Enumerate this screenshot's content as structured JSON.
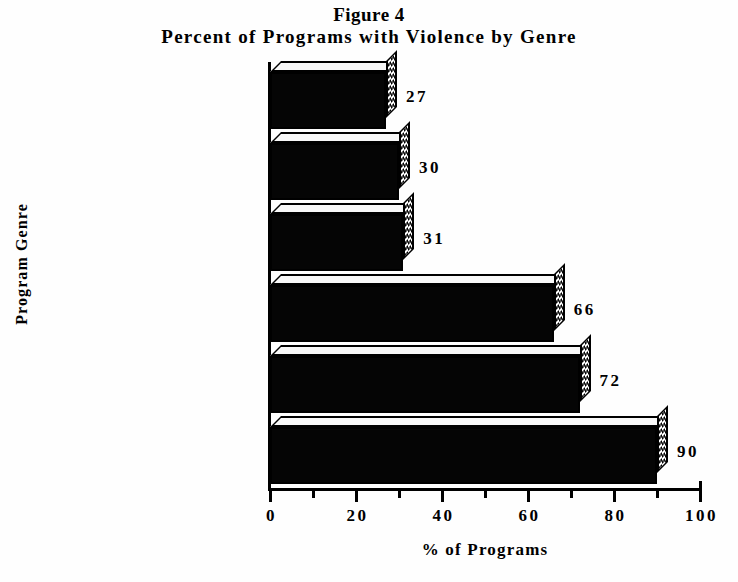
{
  "chart_data": {
    "type": "bar",
    "orientation": "horizontal",
    "title": "Figure 4",
    "subtitle": "Percent of Programs with Violence by Genre",
    "xlabel": "% of Programs",
    "ylabel": "Program Genre",
    "categories": [
      "Comedy Series",
      "Reality Based",
      "Music Videos",
      "Children Series",
      "Drama Series",
      "Movies"
    ],
    "values": [
      27,
      30,
      31,
      66,
      72,
      90
    ],
    "value_labels": [
      "27",
      "30",
      "31",
      "66",
      "72",
      "90"
    ],
    "xlim": [
      0,
      100
    ],
    "xticks": [
      0,
      20,
      40,
      60,
      80,
      100
    ],
    "xticklabels": [
      "0",
      "20",
      "40",
      "60",
      "80",
      "100"
    ],
    "xminorticks": [
      10,
      30,
      50,
      70,
      90
    ],
    "grid": false,
    "legend": false,
    "style": "3d-bar",
    "colors": {
      "bar_front": "#050505",
      "bar_top": "#f8f8f8",
      "bar_side_pattern": "#000000",
      "background": "#ffffff",
      "axis": "#000000"
    }
  }
}
